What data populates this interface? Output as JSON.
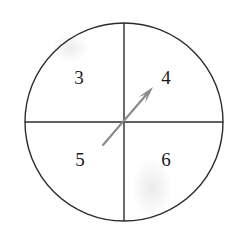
{
  "figure": {
    "type": "diagram",
    "background_color": "#ffffff",
    "line_color": "#2b2b2b",
    "arrow_color": "#8a8a8a",
    "label_color": "#1a1a1a",
    "circle": {
      "center_x": 124,
      "center_y": 122,
      "radius": 99,
      "stroke_width": 1.4
    },
    "axes": {
      "vertical": {
        "x": 124,
        "y1": 23,
        "y2": 221,
        "stroke_width": 1.4
      },
      "horizontal": {
        "y": 122,
        "x1": 25,
        "x2": 223,
        "stroke_width": 1.4
      }
    },
    "arrow": {
      "name": "vector-arrow",
      "tail_x": 103,
      "tail_y": 145,
      "tip_x": 153,
      "tip_y": 87,
      "stroke_width": 2.1,
      "head_length": 17,
      "head_half_width": 4.5,
      "direction": "up-right",
      "points_into_quadrant": "4"
    },
    "labels": [
      {
        "name": "quadrant-label-3",
        "text": "3",
        "x": 79,
        "y": 80,
        "quadrant": "upper-left"
      },
      {
        "name": "quadrant-label-4",
        "text": "4",
        "x": 166,
        "y": 80,
        "quadrant": "upper-right"
      },
      {
        "name": "quadrant-label-5",
        "text": "5",
        "x": 80,
        "y": 162,
        "quadrant": "lower-left"
      },
      {
        "name": "quadrant-label-6",
        "text": "6",
        "x": 166,
        "y": 162,
        "quadrant": "lower-right"
      }
    ]
  }
}
